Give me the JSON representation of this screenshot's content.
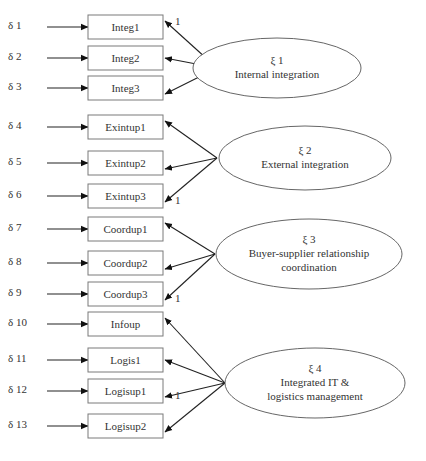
{
  "diagram": {
    "title": "",
    "colors": {
      "stroke": "#222222",
      "box_stroke": "#7a7a7a",
      "text": "#333333",
      "background": "#ffffff"
    },
    "factors": [
      {
        "id": "xi1",
        "symbol": "ξ 1",
        "label_lines": [
          "Internal integration"
        ],
        "cx": 277,
        "cy": 68,
        "rx": 84,
        "ry": 30,
        "apex": [
          217,
          68
        ],
        "indicators": [
          {
            "error": "δ 1",
            "name": "Integ1",
            "y": 15,
            "loading_label": "1"
          },
          {
            "error": "δ 2",
            "name": "Integ2",
            "y": 46,
            "loading_label": ""
          },
          {
            "error": "δ 3",
            "name": "Integ3",
            "y": 76,
            "loading_label": ""
          }
        ]
      },
      {
        "id": "xi2",
        "symbol": "ξ 2",
        "label_lines": [
          "External integration"
        ],
        "cx": 305,
        "cy": 158,
        "rx": 86,
        "ry": 32,
        "apex": [
          217,
          158
        ],
        "indicators": [
          {
            "error": "δ 4",
            "name": "Exintup1",
            "y": 115,
            "loading_label": ""
          },
          {
            "error": "δ 5",
            "name": "Exintup2",
            "y": 151,
            "loading_label": ""
          },
          {
            "error": "δ 6",
            "name": "Exintup3",
            "y": 184,
            "loading_label": "1"
          }
        ]
      },
      {
        "id": "xi3",
        "symbol": "ξ 3",
        "label_lines": [
          "Buyer-supplier relationship",
          "coordination"
        ],
        "cx": 309,
        "cy": 254,
        "rx": 93,
        "ry": 35,
        "apex": [
          215,
          254
        ],
        "indicators": [
          {
            "error": "δ 7",
            "name": "Coordup1",
            "y": 217,
            "loading_label": ""
          },
          {
            "error": "δ 8",
            "name": "Coordup2",
            "y": 251,
            "loading_label": ""
          },
          {
            "error": "δ 9",
            "name": "Coordup3",
            "y": 282,
            "loading_label": "1"
          }
        ]
      },
      {
        "id": "xi4",
        "symbol": "ξ 4",
        "label_lines": [
          "Integrated IT &",
          "logistics management"
        ],
        "cx": 315,
        "cy": 383,
        "rx": 90,
        "ry": 35,
        "apex": [
          225,
          383
        ],
        "indicators": [
          {
            "error": "δ 10",
            "name": "Infoup",
            "y": 312,
            "loading_label": ""
          },
          {
            "error": "δ 11",
            "name": "Logis1",
            "y": 348,
            "loading_label": ""
          },
          {
            "error": "δ 12",
            "name": "Logisup1",
            "y": 379,
            "loading_label": "1"
          },
          {
            "error": "δ 13",
            "name": "Logisup2",
            "y": 414,
            "loading_label": ""
          }
        ]
      }
    ]
  }
}
